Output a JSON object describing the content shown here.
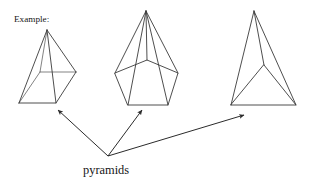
{
  "diagram": {
    "title_label": "Example:",
    "callout_label": "pyramids",
    "stroke_color": "#3a3a3a",
    "hidden_stroke_color": "#6d6d6d",
    "arrow_color": "#2b2b2b",
    "background_color": "#ffffff",
    "canvas": {
      "width": 313,
      "height": 178
    }
  },
  "shapes": [
    {
      "name": "square-pyramid",
      "label": "square-based pyramid",
      "apex": [
        47,
        30
      ],
      "base_vertices": [
        [
          19,
          103
        ],
        [
          56,
          103
        ],
        [
          76,
          72
        ],
        [
          40,
          72
        ]
      ],
      "visible_edges": [
        "19,103 56,103",
        "56,103 76,72",
        "19,103 40,72",
        "47,30 19,103",
        "47,30 56,103",
        "47,30 76,72"
      ],
      "hidden_edges": [
        "40,72 76,72",
        "47,30 40,72"
      ]
    },
    {
      "name": "pentagonal-pyramid",
      "label": "pentagonal pyramid",
      "apex": [
        146,
        11
      ],
      "base_vertices": [
        [
          128,
          105
        ],
        [
          168,
          105
        ],
        [
          178,
          73
        ],
        [
          147,
          60
        ],
        [
          115,
          73
        ]
      ],
      "visible_edges": [
        "128,105 168,105",
        "168,105 178,73",
        "178,73 147,60",
        "147,60 115,73",
        "115,73 128,105",
        "146,11 128,105",
        "146,11 168,105",
        "146,11 178,73",
        "146,11 115,73",
        "146,11 147,60"
      ],
      "hidden_edges": []
    },
    {
      "name": "triangular-pyramid",
      "label": "triangular pyramid (tetrahedron)",
      "apex": [
        254,
        11
      ],
      "base_vertices": [
        [
          231,
          105
        ],
        [
          296,
          105
        ],
        [
          264,
          65
        ]
      ],
      "visible_edges": [
        "231,105 296,105",
        "296,105 264,65",
        "264,65 231,105",
        "254,11 231,105",
        "254,11 296,105",
        "254,11 264,65"
      ],
      "hidden_edges": []
    }
  ],
  "arrows": [
    {
      "name": "arrow-to-square-pyramid",
      "from": [
        108,
        156
      ],
      "to": [
        57,
        109
      ]
    },
    {
      "name": "arrow-to-pentagonal-pyramid",
      "from": [
        108,
        156
      ],
      "to": [
        143,
        109
      ]
    },
    {
      "name": "arrow-to-triangular-pyramid",
      "from": [
        108,
        156
      ],
      "to": [
        245,
        115
      ]
    }
  ],
  "labels": {
    "example": {
      "text": "Example:",
      "x": 14,
      "y": 22
    },
    "pyramids": {
      "text": "pyramids",
      "x": 83,
      "y": 174
    }
  }
}
